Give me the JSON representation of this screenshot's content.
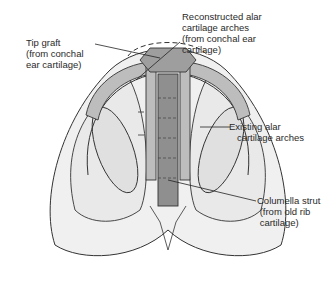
{
  "diagram": {
    "colors": {
      "skin_fill": "#efefef",
      "skin_outline": "#333333",
      "cartilage_fill": "#bdbdbd",
      "graft_fill": "#9e9e9e",
      "strut_fill": "#8f8f8f",
      "nostril_fill": "#e2e2e2",
      "background": "#ffffff"
    },
    "labels": {
      "tip_graft": "Tip graft\n(from conchal\near cartilage)",
      "reconstructed_arches": "Reconstructed alar\ncartilage arches\n(from conchal ear\ncartilage)",
      "existing_arches": "Existing alar\n   cartilage arches",
      "columella_strut": "Columella strut\n (from old rib\n cartilage)"
    }
  }
}
